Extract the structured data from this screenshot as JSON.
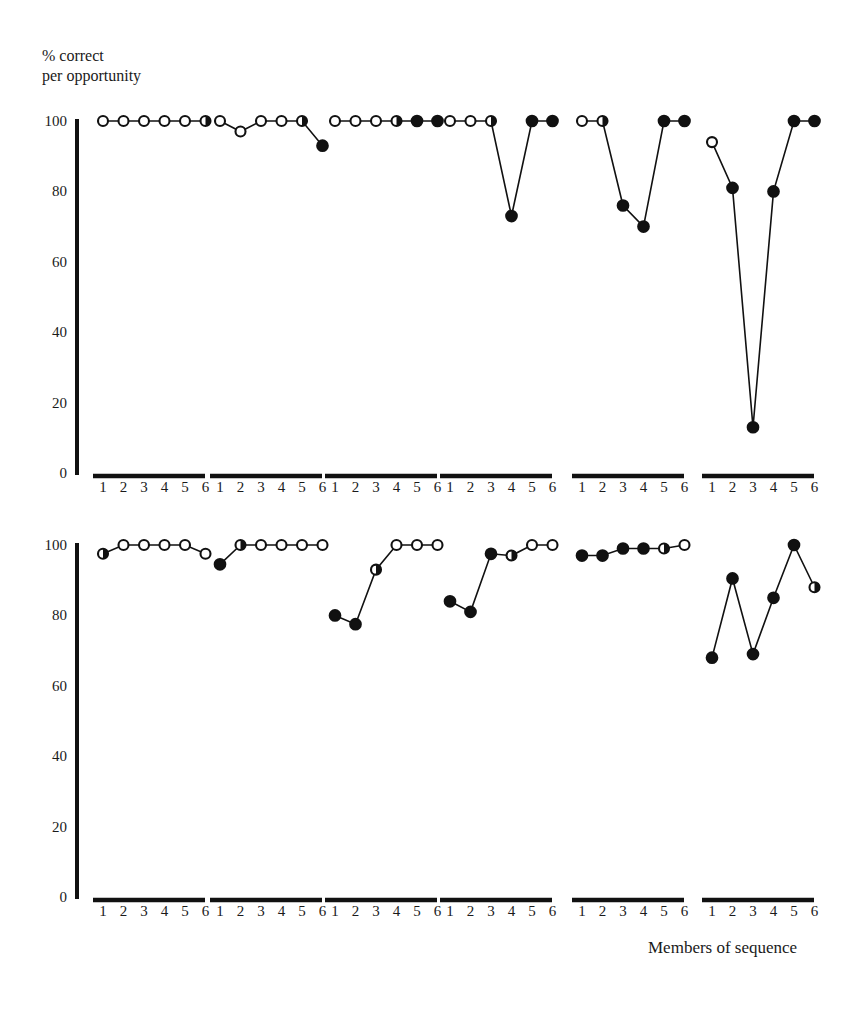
{
  "chart_data": {
    "type": "line",
    "title": "",
    "ylabel": "% correct\nper opportunity",
    "xlabel": "Members of sequence",
    "x": [
      1,
      2,
      3,
      4,
      5,
      6
    ],
    "xtick_labels": [
      "1",
      "2",
      "3",
      "4",
      "5",
      "6"
    ],
    "ytick_labels": [
      "0",
      "20",
      "40",
      "60",
      "80",
      "100"
    ],
    "yticks": [
      0,
      20,
      40,
      60,
      80,
      100
    ],
    "ylim": [
      0,
      100
    ],
    "xlim": [
      0.5,
      6.5
    ],
    "grid": false,
    "legend": "none",
    "marker_styles": {
      "open": "open circle (unfilled)",
      "filled": "filled circle (solid black)",
      "half": "half-filled circle"
    },
    "panel_layout": {
      "rows": 2,
      "cols": 6
    },
    "panels": [
      {
        "row": 1,
        "col": 1,
        "values": [
          100,
          100,
          100,
          100,
          100,
          100
        ],
        "markers": [
          "open",
          "open",
          "open",
          "open",
          "open",
          "half"
        ]
      },
      {
        "row": 1,
        "col": 2,
        "values": [
          100,
          97,
          100,
          100,
          100,
          93
        ],
        "markers": [
          "open",
          "open",
          "open",
          "open",
          "half",
          "filled"
        ]
      },
      {
        "row": 1,
        "col": 3,
        "values": [
          100,
          100,
          100,
          100,
          100,
          100
        ],
        "markers": [
          "open",
          "open",
          "open",
          "half",
          "filled",
          "filled"
        ]
      },
      {
        "row": 1,
        "col": 4,
        "values": [
          100,
          100,
          100,
          73,
          100,
          100
        ],
        "markers": [
          "open",
          "open",
          "half",
          "filled",
          "filled",
          "filled"
        ]
      },
      {
        "row": 1,
        "col": 5,
        "values": [
          100,
          100,
          76,
          70,
          100,
          100
        ],
        "markers": [
          "open",
          "half",
          "filled",
          "filled",
          "filled",
          "filled"
        ]
      },
      {
        "row": 1,
        "col": 6,
        "values": [
          94,
          81,
          13,
          80,
          100,
          100
        ],
        "markers": [
          "open",
          "filled",
          "filled",
          "filled",
          "filled",
          "filled"
        ]
      },
      {
        "row": 2,
        "col": 1,
        "values": [
          97.5,
          100,
          100,
          100,
          100,
          97.5
        ],
        "markers": [
          "half",
          "open",
          "open",
          "open",
          "open",
          "open"
        ]
      },
      {
        "row": 2,
        "col": 2,
        "values": [
          94.5,
          100,
          100,
          100,
          100,
          100
        ],
        "markers": [
          "filled",
          "half",
          "open",
          "open",
          "open",
          "open"
        ]
      },
      {
        "row": 2,
        "col": 3,
        "values": [
          80,
          77.5,
          93,
          100,
          100,
          100
        ],
        "markers": [
          "filled",
          "filled",
          "half",
          "open",
          "open",
          "open"
        ]
      },
      {
        "row": 2,
        "col": 4,
        "values": [
          84,
          81,
          97.5,
          97,
          100,
          100
        ],
        "markers": [
          "filled",
          "filled",
          "filled",
          "half",
          "open",
          "open"
        ]
      },
      {
        "row": 2,
        "col": 5,
        "values": [
          97,
          97,
          99,
          99,
          99,
          100
        ],
        "markers": [
          "filled",
          "filled",
          "filled",
          "filled",
          "half",
          "open"
        ]
      },
      {
        "row": 2,
        "col": 6,
        "values": [
          68,
          90.5,
          69,
          85,
          100,
          88
        ],
        "markers": [
          "filled",
          "filled",
          "filled",
          "filled",
          "filled",
          "half"
        ]
      }
    ]
  },
  "labels": {
    "y_axis_caption": "% correct\nper opportunity",
    "x_axis_caption": "Members of sequence"
  }
}
